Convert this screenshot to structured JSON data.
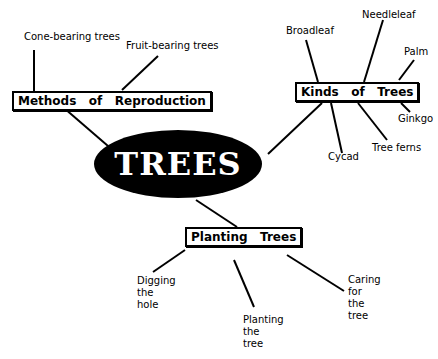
{
  "center": {
    "label": "TREES",
    "fill": "#000000",
    "text_color": "#ffffff"
  },
  "branches": [
    {
      "label": "Methods   of   Reproduction",
      "children": [
        "Cone-bearing trees",
        "Fruit-bearing  trees"
      ]
    },
    {
      "label": "Kinds   of   Trees",
      "children": [
        "Broadleaf",
        "Needleleaf",
        "Palm",
        "Ginkgo",
        "Tree ferns",
        "Cycad"
      ]
    },
    {
      "label": "Planting   Trees",
      "children": [
        "Digging\nthe\nhole",
        "Planting\nthe\ntree",
        "Caring\nfor\nthe\ntree"
      ]
    }
  ]
}
